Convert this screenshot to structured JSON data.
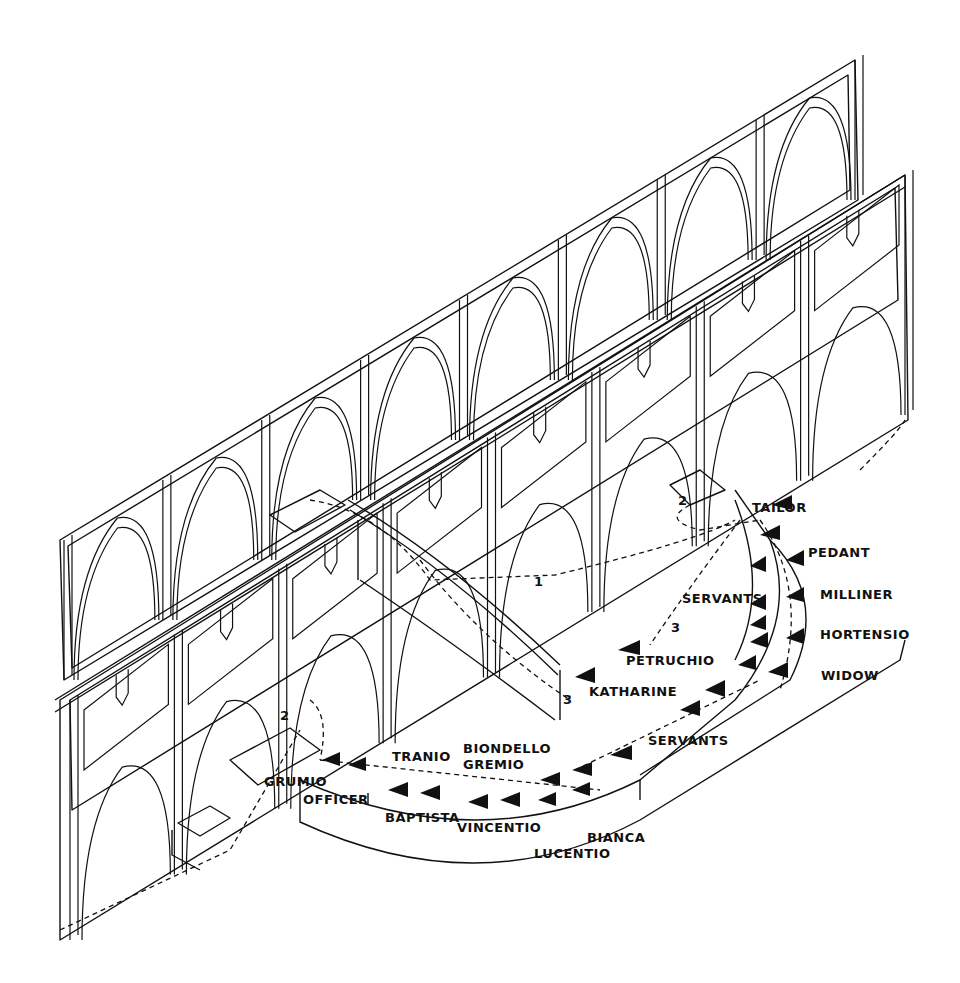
{
  "diagram": {
    "type": "isometric stage blocking diagram",
    "colors": {
      "ink": "#111111",
      "paper": "#ffffff"
    },
    "route_numbers": [
      {
        "id": "r1",
        "label": "1"
      },
      {
        "id": "r2a",
        "label": "2"
      },
      {
        "id": "r2b",
        "label": "2"
      },
      {
        "id": "r3a",
        "label": "3"
      },
      {
        "id": "r3b",
        "label": "3"
      }
    ],
    "characters": {
      "tailor": "TAILOR",
      "pedant": "PEDANT",
      "milliner": "MILLINER",
      "hortensio": "HORTENSIO",
      "widow": "WIDOW",
      "servants_upper": "SERVANTS",
      "petruchio": "PETRUCHIO",
      "katharine": "KATHARINE",
      "servants_lower": "SERVANTS",
      "grumio": "GRUMIO",
      "officer": "OFFICER",
      "tranio": "TRANIO",
      "baptista": "BAPTISTA",
      "biondello": "BIONDELLO",
      "gremio": "GREMIO",
      "vincentio": "VINCENTIO",
      "lucentio": "LUCENTIO",
      "bianca": "BIANCA"
    },
    "markers": {
      "icon": "triangle-arrow-icon",
      "path_style": "dashed"
    }
  }
}
